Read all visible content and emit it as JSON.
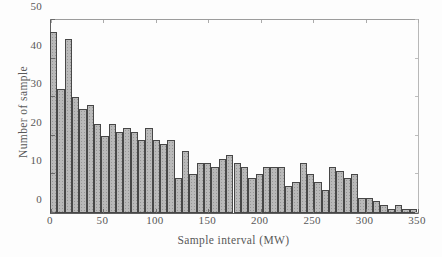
{
  "figure": {
    "xlabel": "Sample interval (MW)",
    "ylabel": "Number of sample",
    "x_tick_labels": [
      "0",
      "50",
      "100",
      "150",
      "200",
      "250",
      "300",
      "350"
    ],
    "y_tick_labels": [
      "0",
      "10",
      "20",
      "30",
      "40",
      "50"
    ],
    "bar_fill_color": "#b9b9b9",
    "bar_edge_color": "#474747",
    "text_color": "#585858"
  },
  "chart_data": {
    "type": "bar",
    "title": "",
    "xlabel": "Sample interval (MW)",
    "ylabel": "Number of sample",
    "xlim": [
      0,
      350
    ],
    "ylim": [
      0,
      50
    ],
    "grid": false,
    "legend": null,
    "bin_width": 7,
    "x_ticks": [
      0,
      50,
      100,
      150,
      200,
      250,
      300,
      350
    ],
    "y_ticks": [
      0,
      10,
      20,
      30,
      40,
      50
    ],
    "bin_starts": [
      0,
      7,
      14,
      21,
      28,
      35,
      42,
      49,
      56,
      63,
      70,
      77,
      84,
      91,
      98,
      105,
      112,
      119,
      126,
      133,
      140,
      147,
      154,
      161,
      168,
      175,
      182,
      189,
      196,
      203,
      210,
      217,
      224,
      231,
      238,
      245,
      252,
      259,
      266,
      273,
      280,
      287,
      294,
      301,
      308,
      315,
      322,
      329,
      336,
      343
    ],
    "values": [
      47,
      32,
      45,
      30,
      27,
      28,
      23,
      20,
      23,
      21,
      22,
      21,
      19,
      22,
      19,
      18,
      19,
      9,
      16,
      10,
      13,
      13,
      12,
      14,
      15,
      13,
      12,
      9,
      10,
      12,
      12,
      12,
      7,
      8,
      13,
      10,
      8,
      6,
      12,
      11,
      9,
      10,
      4,
      4,
      3,
      2,
      1,
      2,
      1,
      1
    ]
  }
}
